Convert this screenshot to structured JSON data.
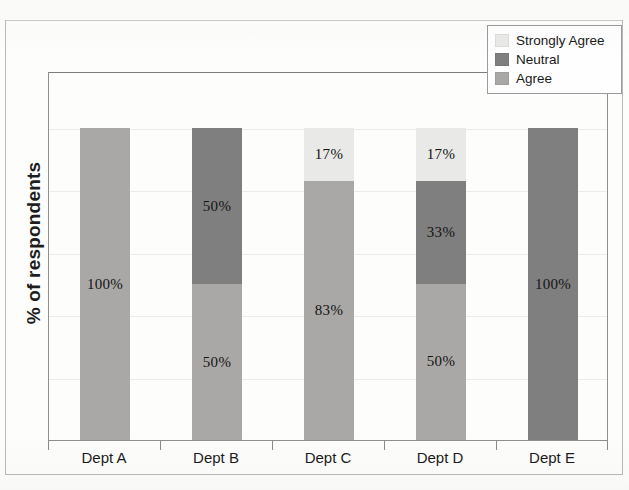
{
  "chart_data": {
    "type": "bar",
    "subtype": "stacked-bar-100-percent",
    "title": "",
    "xlabel": "",
    "ylabel": "% of respondents",
    "ylim": [
      0,
      100
    ],
    "grid": true,
    "legend_position": "top-right",
    "categories": [
      "Dept A",
      "Dept B",
      "Dept C",
      "Dept D",
      "Dept E"
    ],
    "series": [
      {
        "name": "Strongly Agree",
        "color": "#e9e9e7",
        "values": [
          0,
          0,
          17,
          17,
          0
        ],
        "labels": [
          "",
          "",
          "17%",
          "17%",
          ""
        ]
      },
      {
        "name": "Neutral",
        "color": "#807f7f",
        "values": [
          0,
          50,
          0,
          33,
          100
        ],
        "labels": [
          "",
          "50%",
          "",
          "33%",
          "100%"
        ]
      },
      {
        "name": "Agree",
        "color": "#a9a8a6",
        "values": [
          100,
          50,
          83,
          50,
          0
        ],
        "labels": [
          "100%",
          "50%",
          "83%",
          "50%",
          ""
        ]
      }
    ],
    "gridline_values": [
      100,
      80,
      60,
      40,
      20
    ]
  },
  "axes": {
    "y_title": "% of respondents",
    "x_labels": [
      {
        "label": "Dept A"
      },
      {
        "label": "Dept B"
      },
      {
        "label": "Dept C"
      },
      {
        "label": "Dept D"
      },
      {
        "label": "Dept E"
      }
    ]
  },
  "legend": {
    "items": [
      {
        "label": "Strongly Agree",
        "color": "#e9e9e7"
      },
      {
        "label": "Neutral",
        "color": "#807f7f"
      },
      {
        "label": "Agree",
        "color": "#a9a8a6"
      }
    ]
  },
  "bars": [
    {
      "category": "Dept A",
      "segments": [
        {
          "series": "Agree",
          "value": 100,
          "label": "100%",
          "color": "#a9a8a6"
        }
      ]
    },
    {
      "category": "Dept B",
      "segments": [
        {
          "series": "Neutral",
          "value": 50,
          "label": "50%",
          "color": "#807f7f"
        },
        {
          "series": "Agree",
          "value": 50,
          "label": "50%",
          "color": "#a9a8a6"
        }
      ]
    },
    {
      "category": "Dept C",
      "segments": [
        {
          "series": "Strongly Agree",
          "value": 17,
          "label": "17%",
          "color": "#e9e9e7"
        },
        {
          "series": "Agree",
          "value": 83,
          "label": "83%",
          "color": "#a9a8a6"
        }
      ]
    },
    {
      "category": "Dept D",
      "segments": [
        {
          "series": "Strongly Agree",
          "value": 17,
          "label": "17%",
          "color": "#e9e9e7"
        },
        {
          "series": "Neutral",
          "value": 33,
          "label": "33%",
          "color": "#807f7f"
        },
        {
          "series": "Agree",
          "value": 50,
          "label": "50%",
          "color": "#a9a8a6"
        }
      ]
    },
    {
      "category": "Dept E",
      "segments": [
        {
          "series": "Neutral",
          "value": 100,
          "label": "100%",
          "color": "#807f7f"
        }
      ]
    }
  ]
}
